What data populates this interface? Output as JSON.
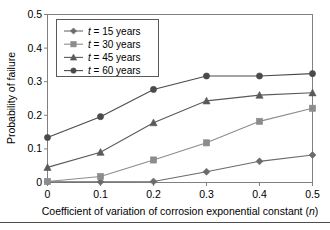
{
  "chart_data": {
    "type": "line",
    "title": "",
    "xlabel": "Coefficient of variation of corrosion exponential constant (n)",
    "ylabel": "Probability of failure",
    "x": [
      0,
      0.1,
      0.2,
      0.3,
      0.4,
      0.5
    ],
    "xlim": [
      0,
      0.5
    ],
    "ylim": [
      0,
      0.5
    ],
    "xticks": [
      "0",
      "0.1",
      "0.2",
      "0.3",
      "0.4",
      "0.5"
    ],
    "yticks": [
      "0",
      "0.1",
      "0.2",
      "0.3",
      "0.4",
      "0.5"
    ],
    "grid": false,
    "legend_position": "upper-left",
    "series": [
      {
        "name": "t = 15 years",
        "marker": "diamond",
        "color": "#6b6b6b",
        "values": [
          0.002,
          0.002,
          0.003,
          0.032,
          0.063,
          0.082
        ]
      },
      {
        "name": "t = 30 years",
        "marker": "square",
        "color": "#8c8c8c",
        "values": [
          0.003,
          0.018,
          0.067,
          0.118,
          0.182,
          0.221
        ]
      },
      {
        "name": "t = 45 years",
        "marker": "triangle",
        "color": "#5a5a5a",
        "values": [
          0.045,
          0.09,
          0.178,
          0.243,
          0.26,
          0.267
        ]
      },
      {
        "name": "t = 60 years",
        "marker": "circle",
        "color": "#4a4a4a",
        "values": [
          0.134,
          0.196,
          0.277,
          0.317,
          0.317,
          0.324
        ]
      }
    ]
  },
  "legend": {
    "entries": [
      {
        "variable": "t",
        "equals_text": "= 15 years"
      },
      {
        "variable": "t",
        "equals_text": "= 30 years"
      },
      {
        "variable": "t",
        "equals_text": "= 45 years"
      },
      {
        "variable": "t",
        "equals_text": "= 60 years"
      }
    ]
  },
  "axes": {
    "x_title_main": "Coefficient of variation of corrosion exponential constant (",
    "x_title_italic": "n",
    "x_title_end": ")",
    "y_title": "Probability of failure"
  }
}
